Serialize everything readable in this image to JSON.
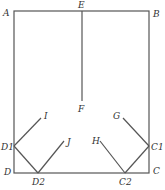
{
  "diagram": {
    "stroke_color": "#555555",
    "label_color": "#333333",
    "points": {
      "A": {
        "label": "A",
        "x": 14,
        "y": 11
      },
      "B": {
        "label": "B",
        "x": 149,
        "y": 11
      },
      "C": {
        "label": "C",
        "x": 149,
        "y": 173
      },
      "D": {
        "label": "D",
        "x": 14,
        "y": 173
      },
      "E": {
        "label": "E",
        "x": 82,
        "y": 11
      },
      "F": {
        "label": "F",
        "x": 82,
        "y": 101
      },
      "G": {
        "label": "G",
        "x": 123,
        "y": 118
      },
      "H": {
        "label": "H",
        "x": 100,
        "y": 141
      },
      "I": {
        "label": "I",
        "x": 41,
        "y": 118
      },
      "J": {
        "label": "J",
        "x": 64,
        "y": 141
      },
      "C1": {
        "label": "C1",
        "x": 149,
        "y": 146
      },
      "C2": {
        "label": "C2",
        "x": 125,
        "y": 173
      },
      "D1": {
        "label": "D1",
        "x": 14,
        "y": 146
      },
      "D2": {
        "label": "D2",
        "x": 38,
        "y": 173
      }
    },
    "segments": [
      [
        "A",
        "B"
      ],
      [
        "B",
        "C"
      ],
      [
        "C",
        "D"
      ],
      [
        "D",
        "A"
      ],
      [
        "E",
        "F"
      ],
      [
        "D1",
        "I"
      ],
      [
        "D1",
        "D2"
      ],
      [
        "D2",
        "J"
      ],
      [
        "C1",
        "G"
      ],
      [
        "C1",
        "C2"
      ],
      [
        "C2",
        "H"
      ]
    ]
  }
}
